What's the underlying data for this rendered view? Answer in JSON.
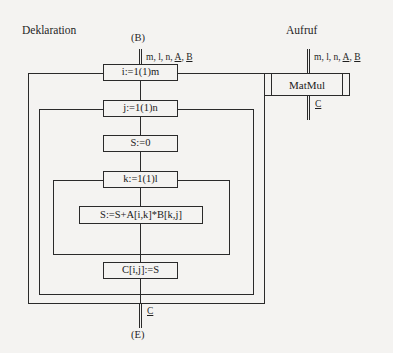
{
  "diagram": {
    "type": "program-flow-diagram",
    "sections": {
      "declaration_title": "Deklaration",
      "call_title": "Aufruf"
    },
    "terminals": {
      "begin": "(B)",
      "end": "(E)"
    },
    "dataflow": {
      "inputs_label": "m, l, n, A, B",
      "inputs_plain": "m, l, n, ",
      "inputs_underlined_a": "A",
      "inputs_sep": ", ",
      "inputs_underlined_b": "B",
      "output_label": "C"
    },
    "declaration_boxes": [
      {
        "id": "loop-i",
        "text": "i:=1(1)m",
        "kind": "loop-header"
      },
      {
        "id": "loop-j",
        "text": "j:=1(1)n",
        "kind": "loop-header"
      },
      {
        "id": "init-s",
        "text": "S:=0",
        "kind": "statement"
      },
      {
        "id": "loop-k",
        "text": "k:=1(1)l",
        "kind": "loop-header"
      },
      {
        "id": "accumulate",
        "text": "S:=S+A[i,k]*B[k,j]",
        "kind": "statement"
      },
      {
        "id": "assign-c",
        "text": "C[i,j]:=S",
        "kind": "statement"
      }
    ],
    "call_box": {
      "id": "matmul-call",
      "text": "MatMul",
      "kind": "subroutine-call"
    },
    "colors": {
      "background": "#f4f3f1",
      "stroke": "#2a2a2a",
      "text": "#1a1a1a"
    }
  }
}
